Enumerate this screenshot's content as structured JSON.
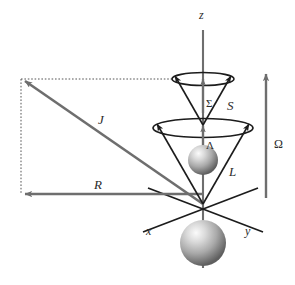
{
  "figure": {
    "type": "vector-diagram",
    "title": "",
    "background_color": "#ffffff",
    "width": 295,
    "height": 285
  },
  "colors": {
    "gray_vector": "#6e6e6e",
    "dark_line": "#1c1c1c",
    "dotted_line": "#555555",
    "label_text": "#2b2b2b",
    "sphere_light": "#f2f2f2",
    "sphere_mid": "#a8a8a8",
    "sphere_dark": "#636363"
  },
  "labels": {
    "axis_z": "z",
    "axis_x": "x",
    "axis_y": "y",
    "vector_J": "J",
    "vector_R": "R",
    "vector_L": "L",
    "vector_S": "S",
    "projection_Omega": "Ω",
    "projection_Sigma": "Σ",
    "projection_Lambda": "Λ"
  },
  "elements": [
    {
      "name": "z-axis",
      "kind": "axis",
      "label": "z"
    },
    {
      "name": "x-axis",
      "kind": "axis",
      "label": "x"
    },
    {
      "name": "y-axis",
      "kind": "axis",
      "label": "y"
    },
    {
      "name": "J-vector",
      "kind": "gray-arrow",
      "label": "J"
    },
    {
      "name": "R-vector",
      "kind": "gray-arrow",
      "label": "R"
    },
    {
      "name": "Omega-vector",
      "kind": "gray-arrow",
      "label": "Ω"
    },
    {
      "name": "Sigma-vector",
      "kind": "gray-arrow",
      "label": "Σ"
    },
    {
      "name": "Lambda-vector",
      "kind": "gray-arrow",
      "label": "Λ"
    },
    {
      "name": "L-precession-cone",
      "kind": "cone",
      "label": "L"
    },
    {
      "name": "S-precession-cone",
      "kind": "cone",
      "label": "S"
    },
    {
      "name": "upper-atom-sphere",
      "kind": "sphere"
    },
    {
      "name": "lower-atom-sphere",
      "kind": "sphere"
    },
    {
      "name": "dotted-projection-rectangle",
      "kind": "dotted-guide"
    }
  ]
}
